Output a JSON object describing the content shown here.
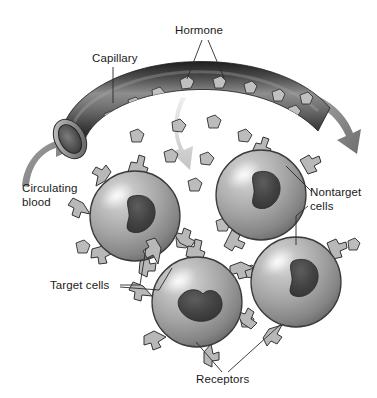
{
  "figure": {
    "background_color": "#ffffff",
    "width": 377,
    "height": 398
  },
  "labels": [
    {
      "id": "hormone",
      "text": "Hormone",
      "x": 175,
      "y": 34,
      "anchor": "start"
    },
    {
      "id": "capillary",
      "text": "Capillary",
      "x": 92,
      "y": 62,
      "anchor": "start"
    },
    {
      "id": "circulating_line1",
      "text": "Circulating",
      "x": 22,
      "y": 192,
      "anchor": "start"
    },
    {
      "id": "circulating_line2",
      "text": "blood",
      "x": 22,
      "y": 206,
      "anchor": "start"
    },
    {
      "id": "nontarget_line1",
      "text": "Nontarget",
      "x": 310,
      "y": 196,
      "anchor": "start"
    },
    {
      "id": "nontarget_line2",
      "text": "cells",
      "x": 310,
      "y": 210,
      "anchor": "start"
    },
    {
      "id": "target_cells",
      "text": "Target cells",
      "x": 50,
      "y": 289,
      "anchor": "start"
    },
    {
      "id": "receptors",
      "text": "Receptors",
      "x": 196,
      "y": 383,
      "anchor": "start"
    }
  ],
  "colors": {
    "background": "#ffffff",
    "text": "#1a1a1a",
    "leader_line": "#2a2a2a",
    "capillary_dark": "#2e2e2e",
    "capillary_mid": "#6f6f6f",
    "capillary_light": "#9a9a9a",
    "capillary_rim": "#c9c9c9",
    "cell_body_light": "#d2d2d2",
    "cell_body_mid": "#9d9d9d",
    "cell_body_dark": "#6b6b6b",
    "cell_outline": "#3a3a3a",
    "nucleus_dark": "#3b3b3b",
    "nucleus_mid": "#565656",
    "receptor_fill": "#b4b4b4",
    "receptor_outline": "#3a3a3a",
    "hormone_fill": "#b9b9b9",
    "hormone_outline": "#2f2f2f",
    "arrow_gray": "#8c8c8c",
    "arrow_light": "#dcdcdc"
  },
  "structures": {
    "capillary": {
      "name": "capillary",
      "description": "Dark curved blood vessel tube arcing across the top of the figure with an open elliptical lumen at the lower-left end"
    },
    "lumen": {
      "name": "capillary-lumen",
      "description": "Open circular end of the capillary showing the interior"
    },
    "cells": [
      {
        "id": "cell-target-left",
        "type": "target",
        "cx": 135,
        "cy": 216,
        "r": 45,
        "receptor_count": 6,
        "nucleus": "kidney-shaped"
      },
      {
        "id": "cell-nontarget-top",
        "type": "nontarget",
        "cx": 261,
        "cy": 195,
        "r": 45,
        "receptor_count": 3,
        "nucleus": "kidney-shaped"
      },
      {
        "id": "cell-target-bottom",
        "type": "target",
        "cx": 197,
        "cy": 302,
        "r": 45,
        "receptor_count": 6,
        "nucleus": "kidney-shaped"
      },
      {
        "id": "cell-nontarget-right",
        "type": "nontarget",
        "cx": 296,
        "cy": 282,
        "r": 45,
        "receptor_count": 3,
        "nucleus": "kidney-shaped"
      }
    ],
    "arrows": [
      {
        "id": "arrow-inflow",
        "name": "circulating-blood-inflow-arrow",
        "color": "#8c8c8c",
        "direction": "up-right",
        "description": "Curved gray arrow entering the capillary lumen at lower left"
      },
      {
        "id": "arrow-outflow",
        "name": "circulating-blood-outflow-arrow",
        "color": "#8c8c8c",
        "direction": "down-right",
        "description": "Curved gray arrow leaving the capillary at upper right"
      },
      {
        "id": "arrow-diffusion",
        "name": "hormone-diffusion-arrow",
        "color": "#dcdcdc",
        "direction": "down",
        "description": "Pale curved arrow showing hormone leaving the capillary toward the cells"
      }
    ],
    "hormone_particles_in_vessel": 17,
    "hormone_particles_in_tissue": 14
  }
}
